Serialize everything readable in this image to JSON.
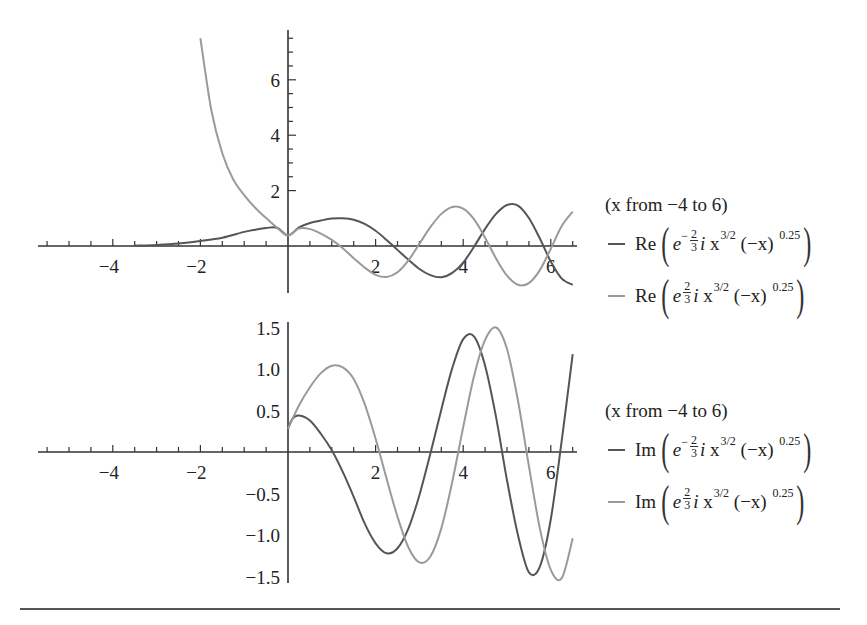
{
  "chart_data": [
    {
      "type": "line",
      "title": "",
      "xlabel": "",
      "ylabel": "",
      "xlim": [
        -5.7,
        6.5
      ],
      "ylim": [
        -1.7,
        7.8
      ],
      "grid": false,
      "legend_position": "right",
      "x_ticks": [
        -4,
        -2,
        2,
        4,
        6
      ],
      "y_ticks": [
        2,
        4,
        6
      ],
      "legend_title": "(x from −4 to 6)",
      "series": [
        {
          "name": "Re[e^{-(2/3) i x^{3/2}} (-x)^{0.25}]",
          "color": "#555555",
          "x": [
            -3.5,
            -3,
            -2.5,
            -2,
            -1.5,
            -1,
            -0.75,
            -0.5,
            -0.25,
            0,
            0.25,
            0.5,
            0.75,
            1,
            1.25,
            1.5,
            1.75,
            2,
            2.25,
            2.5,
            2.75,
            3,
            3.25,
            3.5,
            3.75,
            4,
            4.25,
            4.5,
            4.75,
            5,
            5.25,
            5.5,
            5.75,
            6,
            6.25,
            6.5
          ],
          "y": [
            0.01,
            0.04,
            0.09,
            0.18,
            0.3,
            0.51,
            0.59,
            0.65,
            0.66,
            0.38,
            0.67,
            0.83,
            0.92,
            0.99,
            1.0,
            0.95,
            0.8,
            0.55,
            0.22,
            -0.14,
            -0.5,
            -0.83,
            -1.05,
            -1.13,
            -0.97,
            -0.6,
            -0.02,
            0.62,
            1.16,
            1.48,
            1.46,
            1.01,
            0.27,
            -0.56,
            -1.18,
            -1.4
          ]
        },
        {
          "name": "Re[e^{(2/3) i x^{3/2}} (-x)^{0.25}]",
          "color": "#9a9a9a",
          "x": [
            -2,
            -1.75,
            -1.5,
            -1.25,
            -1,
            -0.75,
            -0.5,
            -0.25,
            0,
            0.25,
            0.5,
            0.75,
            1,
            1.25,
            1.5,
            1.75,
            2,
            2.25,
            2.5,
            2.75,
            3,
            3.25,
            3.5,
            3.75,
            4,
            4.25,
            4.5,
            4.75,
            5,
            5.25,
            5.5,
            5.75,
            6,
            6.25,
            6.5
          ],
          "y": [
            7.5,
            4.9,
            3.35,
            2.4,
            1.84,
            1.38,
            1.01,
            0.66,
            0.38,
            0.63,
            0.61,
            0.45,
            0.22,
            -0.08,
            -0.44,
            -0.78,
            -1.04,
            -1.12,
            -0.95,
            -0.52,
            0.08,
            0.68,
            1.16,
            1.41,
            1.35,
            0.96,
            0.3,
            -0.45,
            -1.07,
            -1.4,
            -1.34,
            -0.87,
            -0.1,
            0.72,
            1.24
          ]
        }
      ]
    },
    {
      "type": "line",
      "title": "",
      "xlabel": "",
      "ylabel": "",
      "xlim": [
        -5.7,
        6.5
      ],
      "ylim": [
        -1.6,
        1.55
      ],
      "grid": false,
      "legend_position": "right",
      "x_ticks": [
        -4,
        -2,
        2,
        4,
        6
      ],
      "y_ticks": [
        -1.5,
        -1.0,
        -0.5,
        0.5,
        1.0,
        1.5
      ],
      "legend_title": "(x from −4 to 6)",
      "series": [
        {
          "name": "Im[e^{-(2/3) i x^{3/2}} (-x)^{0.25}]",
          "color": "#555555",
          "x": [
            0,
            0.1,
            0.25,
            0.5,
            0.75,
            1,
            1.25,
            1.5,
            1.75,
            2,
            2.25,
            2.5,
            2.75,
            3,
            3.25,
            3.5,
            3.75,
            4,
            4.25,
            4.5,
            4.75,
            5,
            5.25,
            5.5,
            5.75,
            6,
            6.25,
            6.5
          ],
          "y": [
            0.28,
            0.4,
            0.44,
            0.38,
            0.22,
            0.02,
            -0.24,
            -0.54,
            -0.86,
            -1.1,
            -1.22,
            -1.16,
            -0.92,
            -0.52,
            -0.02,
            0.51,
            1.01,
            1.36,
            1.39,
            1.04,
            0.42,
            -0.34,
            -1.0,
            -1.45,
            -1.38,
            -0.81,
            0.14,
            1.18
          ]
        },
        {
          "name": "Im[e^{(2/3) i x^{3/2}} (-x)^{0.25}]",
          "color": "#9a9a9a",
          "x": [
            0,
            0.25,
            0.5,
            0.75,
            1,
            1.25,
            1.5,
            1.75,
            2,
            2.25,
            2.5,
            2.75,
            3,
            3.25,
            3.5,
            3.75,
            4,
            4.25,
            4.5,
            4.75,
            5,
            5.25,
            5.5,
            5.75,
            6,
            6.25,
            6.5
          ],
          "y": [
            0.28,
            0.56,
            0.78,
            0.95,
            1.04,
            1.02,
            0.88,
            0.58,
            0.16,
            -0.32,
            -0.78,
            -1.15,
            -1.33,
            -1.26,
            -0.92,
            -0.36,
            0.3,
            0.92,
            1.35,
            1.5,
            1.24,
            0.62,
            -0.17,
            -0.92,
            -1.42,
            -1.52,
            -1.04
          ]
        }
      ]
    }
  ],
  "legends": [
    {
      "range": "(x from −4 to 6)",
      "entries": [
        {
          "fn": "Re",
          "sign": "−",
          "num": "2",
          "den": "3",
          "i": "i",
          "x": "x",
          "pow": "3/2",
          "tail": "(−x)",
          "exp": "0.25",
          "color": "#555555"
        },
        {
          "fn": "Re",
          "sign": "",
          "num": "2",
          "den": "3",
          "i": "i",
          "x": "x",
          "pow": "3/2",
          "tail": "(−x)",
          "exp": "0.25",
          "color": "#9a9a9a"
        }
      ]
    },
    {
      "range": "(x from −4 to 6)",
      "entries": [
        {
          "fn": "Im",
          "sign": "−",
          "num": "2",
          "den": "3",
          "i": "i",
          "x": "x",
          "pow": "3/2",
          "tail": "(−x)",
          "exp": "0.25",
          "color": "#555555"
        },
        {
          "fn": "Im",
          "sign": "",
          "num": "2",
          "den": "3",
          "i": "i",
          "x": "x",
          "pow": "3/2",
          "tail": "(−x)",
          "exp": "0.25",
          "color": "#9a9a9a"
        }
      ]
    }
  ],
  "e_symbol": "e",
  "tick_labels": {
    "top_x": [
      "−4",
      "−2",
      "2",
      "4",
      "6"
    ],
    "top_y": [
      "6",
      "4",
      "2"
    ],
    "bottom_x": [
      "−4",
      "−2",
      "2",
      "4",
      "6"
    ],
    "bottom_y": [
      "1.5",
      "1.0",
      "0.5",
      "−0.5",
      "−1.0",
      "−1.5"
    ]
  }
}
